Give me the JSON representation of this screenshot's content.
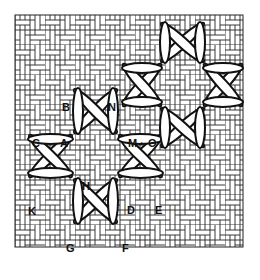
{
  "figure": {
    "type": "needlework stitch diagram",
    "background": "woven basketweave canvas grid",
    "ink_color": "#111111",
    "paper_color": "#ffffff"
  },
  "labels": [
    {
      "id": "B",
      "text": "B",
      "x": 62,
      "y": 102
    },
    {
      "id": "N",
      "text": "N",
      "x": 108,
      "y": 102
    },
    {
      "id": "C",
      "text": "C",
      "x": 32,
      "y": 138
    },
    {
      "id": "A",
      "text": "A",
      "x": 60,
      "y": 138
    },
    {
      "id": "M",
      "text": "M",
      "x": 128,
      "y": 138
    },
    {
      "id": "dot",
      "text": "·",
      "x": 140,
      "y": 138
    },
    {
      "id": "O",
      "text": "O",
      "x": 148,
      "y": 138
    },
    {
      "id": "H",
      "text": "H",
      "x": 82,
      "y": 181
    },
    {
      "id": "K",
      "text": "K",
      "x": 28,
      "y": 206
    },
    {
      "id": "D",
      "text": "D",
      "x": 127,
      "y": 205
    },
    {
      "id": "E",
      "text": "E",
      "x": 155,
      "y": 205
    },
    {
      "id": "G",
      "text": "G",
      "x": 66,
      "y": 243
    },
    {
      "id": "F",
      "text": "F",
      "x": 122,
      "y": 243
    }
  ]
}
